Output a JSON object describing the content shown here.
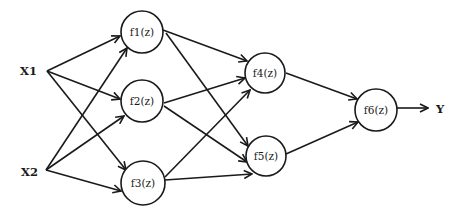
{
  "diagram": {
    "type": "neural-network",
    "inputs": [
      {
        "id": "X1",
        "label": "X1"
      },
      {
        "id": "X2",
        "label": "X2"
      }
    ],
    "nodes": [
      {
        "id": "f1",
        "label": "f1(z)"
      },
      {
        "id": "f2",
        "label": "f2(z)"
      },
      {
        "id": "f3",
        "label": "f3(z)"
      },
      {
        "id": "f4",
        "label": "f4(z)"
      },
      {
        "id": "f5",
        "label": "f5(z)"
      },
      {
        "id": "f6",
        "label": "f6(z)"
      }
    ],
    "output": {
      "id": "Y",
      "label": "Y"
    },
    "edges": [
      [
        "X1",
        "f1"
      ],
      [
        "X1",
        "f2"
      ],
      [
        "X1",
        "f3"
      ],
      [
        "X2",
        "f1"
      ],
      [
        "X2",
        "f2"
      ],
      [
        "X2",
        "f3"
      ],
      [
        "f1",
        "f4"
      ],
      [
        "f1",
        "f5"
      ],
      [
        "f2",
        "f4"
      ],
      [
        "f2",
        "f5"
      ],
      [
        "f3",
        "f4"
      ],
      [
        "f3",
        "f5"
      ],
      [
        "f4",
        "f6"
      ],
      [
        "f5",
        "f6"
      ],
      [
        "f6",
        "Y"
      ]
    ],
    "colors": {
      "stroke": "#1a1a1a",
      "background": "#ffffff"
    }
  }
}
